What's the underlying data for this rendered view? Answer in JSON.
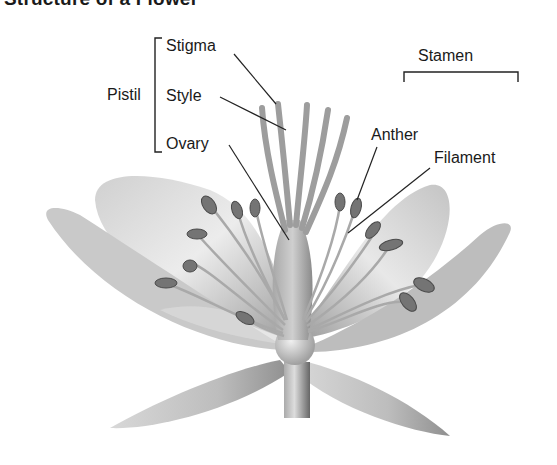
{
  "title": "Structure of a Flower",
  "diagram": {
    "groups": [
      {
        "name": "Pistil",
        "parts": [
          "Stigma",
          "Style",
          "Ovary"
        ]
      },
      {
        "name": "Stamen",
        "parts": [
          "Anther",
          "Filament"
        ]
      }
    ]
  },
  "labels": {
    "pistil": "Pistil",
    "stigma": "Stigma",
    "style": "Style",
    "ovary": "Ovary",
    "stamen": "Stamen",
    "anther": "Anther",
    "filament": "Filament"
  },
  "colors": {
    "text": "#1a1a1a",
    "leader_line": "#222222",
    "petal_light": "#e6e6e6",
    "petal_mid": "#b9b9b9",
    "petal_dark": "#8a8a8a",
    "anther": "#6e6e6e"
  }
}
